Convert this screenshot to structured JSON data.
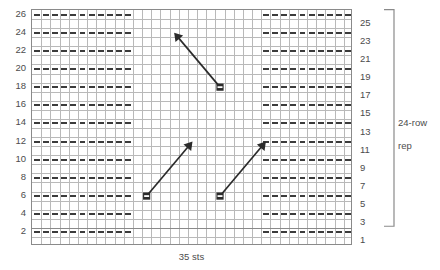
{
  "chart_data": {
    "type": "table",
    "title": "",
    "subtitle": "",
    "xlabel": "35 sts",
    "ylabel": "",
    "grid": true,
    "columns": 35,
    "rows": 26,
    "x": [
      1,
      2,
      3,
      4,
      5,
      6,
      7,
      8,
      9,
      10,
      11,
      12,
      13,
      14,
      15,
      16,
      17,
      18,
      19,
      20,
      21,
      22,
      23,
      24,
      25,
      26,
      27,
      28,
      29,
      30,
      31,
      32,
      33,
      34,
      35
    ],
    "row_labels_left": [
      26,
      24,
      22,
      20,
      18,
      16,
      14,
      12,
      10,
      8,
      6,
      4,
      2
    ],
    "row_labels_right": [
      25,
      23,
      21,
      19,
      17,
      15,
      13,
      11,
      9,
      7,
      5,
      3,
      1
    ],
    "legend": [],
    "annotations": [
      {
        "text": "35 sts",
        "position": "bottom-center"
      },
      {
        "text": "24-row rep",
        "position": "right-bracket"
      }
    ],
    "purl_dash_rows": [
      2,
      4,
      6,
      8,
      10,
      12,
      14,
      16,
      18,
      20,
      22,
      24,
      26
    ],
    "purl_dash_spans": [
      {
        "from_col": 1,
        "to_col": 11
      },
      {
        "from_col": 26,
        "to_col": 35
      }
    ],
    "cable_arrows": [
      {
        "id": "cable-1",
        "from_row": 18,
        "from_col": 21,
        "to_row": 24,
        "to_col": 16,
        "direction": "up-left"
      },
      {
        "id": "cable-2",
        "from_row": 6,
        "from_col": 13,
        "to_row": 12,
        "to_col": 18,
        "direction": "up-right"
      },
      {
        "id": "cable-3",
        "from_row": 6,
        "from_col": 21,
        "to_row": 12,
        "to_col": 26,
        "direction": "up-right"
      }
    ],
    "repeat_bracket": {
      "label_line1": "24-row",
      "label_line2": "rep",
      "from_row": 3,
      "to_row": 26
    }
  },
  "chart": {
    "bottom_label": "35 sts",
    "repeat_label_line1": "24-row",
    "repeat_label_line2": "rep",
    "row_numbers_left": [
      "26",
      "24",
      "22",
      "20",
      "18",
      "16",
      "14",
      "12",
      "10",
      "8",
      "6",
      "4",
      "2"
    ],
    "row_numbers_right": [
      "25",
      "23",
      "21",
      "19",
      "17",
      "15",
      "13",
      "11",
      "9",
      "7",
      "5",
      "3",
      "1"
    ]
  },
  "colors": {
    "grid_minor": "#b9b9b9",
    "grid_major": "#8a8a8a",
    "border": "#8a8a8a",
    "dash": "#3b3b3b",
    "arrow": "#2b2b2b",
    "text": "#4c4c4c",
    "background": "#ffffff"
  }
}
